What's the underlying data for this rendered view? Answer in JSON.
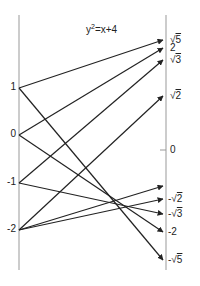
{
  "title": {
    "base": "y",
    "exp": "2",
    "rest": "=x+4"
  },
  "left_axis": {
    "labels": [
      {
        "text": "1",
        "y": 88
      },
      {
        "text": "0",
        "y": 135
      },
      {
        "text": "-1",
        "y": 183
      },
      {
        "text": "-2",
        "y": 230
      }
    ]
  },
  "right_axis": {
    "labels": [
      {
        "sign": "",
        "radical": true,
        "value": "5",
        "y": 40
      },
      {
        "sign": "",
        "radical": false,
        "value": "2",
        "y": 48
      },
      {
        "sign": "",
        "radical": true,
        "value": "3",
        "y": 60
      },
      {
        "sign": "",
        "radical": true,
        "value": "2",
        "y": 96
      },
      {
        "sign": "",
        "radical": false,
        "value": "0",
        "y": 150
      },
      {
        "sign": "-",
        "radical": true,
        "value": "2",
        "y": 199
      },
      {
        "sign": "-",
        "radical": true,
        "value": "3",
        "y": 214
      },
      {
        "sign": "-",
        "radical": false,
        "value": "2",
        "y": 232
      },
      {
        "sign": "-",
        "radical": true,
        "value": "5",
        "y": 260
      }
    ]
  },
  "arrows": [
    {
      "from": "1",
      "to": "√5",
      "y1": 88,
      "y2": 40
    },
    {
      "from": "1",
      "to": "-√5",
      "y1": 88,
      "y2": 260
    },
    {
      "from": "0",
      "to": "2",
      "y1": 135,
      "y2": 48
    },
    {
      "from": "0",
      "to": "-2",
      "y1": 135,
      "y2": 232
    },
    {
      "from": "-1",
      "to": "√3",
      "y1": 183,
      "y2": 60
    },
    {
      "from": "-1",
      "to": "-√3",
      "y1": 183,
      "y2": 214
    },
    {
      "from": "-2",
      "to": "√2",
      "y1": 230,
      "y2": 96
    },
    {
      "from": "-2",
      "to": "",
      "y1": 230,
      "y2": 186
    },
    {
      "from": "-2",
      "to": "-√2",
      "y1": 230,
      "y2": 199
    }
  ],
  "colors": {
    "line": "#222222",
    "axis": "#999999"
  }
}
